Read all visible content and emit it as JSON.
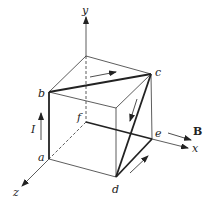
{
  "figure": {
    "colors": {
      "line": "#333333",
      "thick": "#222222",
      "background": "#ffffff"
    },
    "labels": {
      "y": "y",
      "x": "x",
      "z": "z",
      "a": "a",
      "b": "b",
      "c": "c",
      "d": "d",
      "e": "e",
      "f": "f",
      "current": "I",
      "field": "B"
    },
    "points": {
      "f": [
        86,
        122
      ],
      "top_back_left": [
        86,
        56
      ],
      "b": [
        49,
        92
      ],
      "c": [
        151,
        74
      ],
      "top_front_right": [
        116,
        108
      ],
      "a": [
        49,
        159
      ],
      "d": [
        116,
        177
      ],
      "e": [
        152,
        139
      ]
    }
  }
}
